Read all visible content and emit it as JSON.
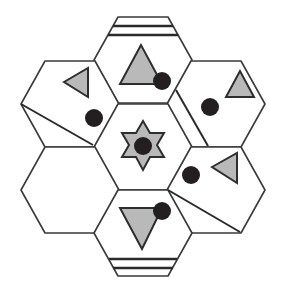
{
  "diagram": {
    "colors": {
      "outline": "#3a3a3a",
      "shape_fill": "#b9b9b9",
      "dot": "#231f20",
      "background": "#ffffff"
    },
    "tiles": [
      {
        "id": "top",
        "contents": [
          "stripes-top",
          "triangle-up",
          "dot"
        ]
      },
      {
        "id": "upper-left",
        "contents": [
          "triangle-left",
          "dot",
          "diagonal-line"
        ]
      },
      {
        "id": "upper-right",
        "contents": [
          "triangle-up",
          "dot",
          "diagonal-line"
        ]
      },
      {
        "id": "center",
        "contents": [
          "six-point-star",
          "dot"
        ]
      },
      {
        "id": "lower-left",
        "contents": []
      },
      {
        "id": "lower-right",
        "contents": [
          "triangle-left",
          "dot",
          "diagonal-line"
        ]
      },
      {
        "id": "bottom",
        "contents": [
          "triangle-down",
          "dot",
          "stripes-bottom"
        ]
      }
    ]
  }
}
